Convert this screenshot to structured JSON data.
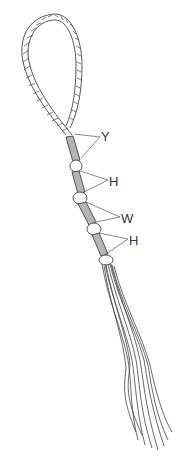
{
  "figure": {
    "type": "technical line drawing",
    "colors": {
      "stroke": "#444444",
      "whipping_fill": "#b5b5b5",
      "background": "#ffffff"
    }
  },
  "labels": [
    {
      "id": "Y",
      "text": "Y",
      "x": 101,
      "y": 130
    },
    {
      "id": "H1",
      "text": "H",
      "x": 109,
      "y": 175
    },
    {
      "id": "W",
      "text": "W",
      "x": 121,
      "y": 212
    },
    {
      "id": "H2",
      "text": "H",
      "x": 129,
      "y": 234
    }
  ]
}
